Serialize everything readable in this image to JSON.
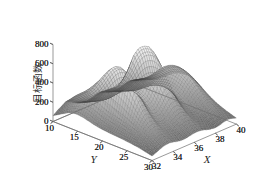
{
  "chart_data": {
    "type": "surface",
    "title": "",
    "xlabel": "X",
    "ylabel": "Y",
    "zlabel": "目标函数",
    "xlim": [
      32,
      40
    ],
    "ylim": [
      10,
      30
    ],
    "zlim": [
      0,
      800
    ],
    "xticks": [
      "32",
      "34",
      "36",
      "38",
      "40"
    ],
    "yticks": [
      "10",
      "15",
      "20",
      "25",
      "30"
    ],
    "zticks": [
      "0",
      "200",
      "400",
      "600",
      "800"
    ],
    "grid": false,
    "legend": "none",
    "colormap": "grayscale",
    "mesh_style": "wireframe-dense",
    "peaks": [
      {
        "x": 35.2,
        "y": 19.5,
        "z": 700
      },
      {
        "x": 37.0,
        "y": 20.5,
        "z": 720
      }
    ],
    "surface_z": [
      [
        60,
        95,
        120,
        150,
        130,
        100,
        80,
        70,
        60,
        70,
        85,
        95,
        80,
        60,
        50,
        45,
        55,
        70,
        80,
        70,
        55
      ],
      [
        90,
        130,
        165,
        200,
        175,
        135,
        105,
        90,
        85,
        95,
        115,
        130,
        110,
        85,
        70,
        62,
        75,
        95,
        108,
        95,
        75
      ],
      [
        120,
        170,
        215,
        255,
        225,
        175,
        135,
        115,
        110,
        125,
        150,
        170,
        145,
        112,
        92,
        82,
        98,
        124,
        140,
        124,
        98
      ],
      [
        150,
        205,
        260,
        300,
        268,
        210,
        162,
        140,
        135,
        152,
        182,
        206,
        176,
        136,
        112,
        100,
        118,
        150,
        170,
        150,
        118
      ],
      [
        168,
        230,
        295,
        345,
        310,
        245,
        190,
        168,
        165,
        188,
        225,
        255,
        218,
        168,
        138,
        122,
        145,
        184,
        208,
        184,
        145
      ],
      [
        172,
        240,
        320,
        400,
        380,
        300,
        230,
        205,
        205,
        240,
        300,
        345,
        292,
        220,
        178,
        156,
        184,
        232,
        262,
        232,
        184
      ],
      [
        165,
        235,
        330,
        460,
        470,
        380,
        285,
        250,
        255,
        310,
        400,
        470,
        390,
        282,
        222,
        192,
        224,
        282,
        318,
        282,
        224
      ],
      [
        152,
        220,
        320,
        500,
        560,
        470,
        350,
        300,
        310,
        390,
        530,
        630,
        512,
        352,
        268,
        228,
        264,
        330,
        372,
        330,
        264
      ],
      [
        138,
        200,
        300,
        510,
        640,
        560,
        410,
        345,
        360,
        460,
        640,
        720,
        600,
        400,
        298,
        252,
        290,
        362,
        408,
        362,
        290
      ],
      [
        126,
        182,
        278,
        495,
        690,
        620,
        450,
        375,
        395,
        510,
        700,
        760,
        640,
        428,
        315,
        265,
        304,
        380,
        428,
        380,
        304
      ],
      [
        118,
        170,
        260,
        470,
        700,
        640,
        462,
        385,
        405,
        525,
        715,
        775,
        652,
        435,
        320,
        268,
        308,
        384,
        432,
        384,
        308
      ],
      [
        112,
        162,
        248,
        440,
        672,
        618,
        446,
        372,
        390,
        505,
        688,
        742,
        626,
        420,
        310,
        260,
        298,
        372,
        418,
        372,
        298
      ],
      [
        108,
        155,
        236,
        405,
        610,
        565,
        410,
        344,
        360,
        462,
        620,
        662,
        562,
        382,
        285,
        240,
        275,
        344,
        386,
        344,
        275
      ],
      [
        104,
        148,
        222,
        362,
        518,
        482,
        356,
        302,
        315,
        398,
        520,
        548,
        470,
        326,
        248,
        210,
        240,
        300,
        338,
        300,
        240
      ],
      [
        100,
        140,
        206,
        315,
        418,
        390,
        296,
        255,
        265,
        328,
        412,
        428,
        372,
        266,
        206,
        176,
        202,
        252,
        284,
        252,
        202
      ],
      [
        94,
        132,
        190,
        272,
        330,
        308,
        240,
        210,
        218,
        264,
        320,
        330,
        290,
        214,
        170,
        146,
        168,
        210,
        236,
        210,
        168
      ],
      [
        88,
        122,
        172,
        232,
        262,
        244,
        196,
        174,
        180,
        214,
        250,
        256,
        228,
        174,
        140,
        122,
        140,
        175,
        196,
        175,
        140
      ],
      [
        80,
        110,
        152,
        196,
        212,
        198,
        162,
        146,
        150,
        175,
        198,
        202,
        182,
        142,
        116,
        102,
        117,
        146,
        164,
        146,
        117
      ],
      [
        70,
        96,
        130,
        162,
        172,
        160,
        134,
        122,
        124,
        142,
        158,
        160,
        146,
        116,
        96,
        85,
        97,
        121,
        136,
        121,
        97
      ],
      [
        58,
        80,
        107,
        130,
        136,
        127,
        108,
        99,
        100,
        113,
        124,
        126,
        116,
        94,
        79,
        70,
        80,
        99,
        111,
        99,
        80
      ],
      [
        46,
        63,
        84,
        100,
        104,
        97,
        84,
        77,
        78,
        87,
        95,
        96,
        89,
        73,
        62,
        56,
        63,
        78,
        87,
        78,
        63
      ]
    ]
  }
}
